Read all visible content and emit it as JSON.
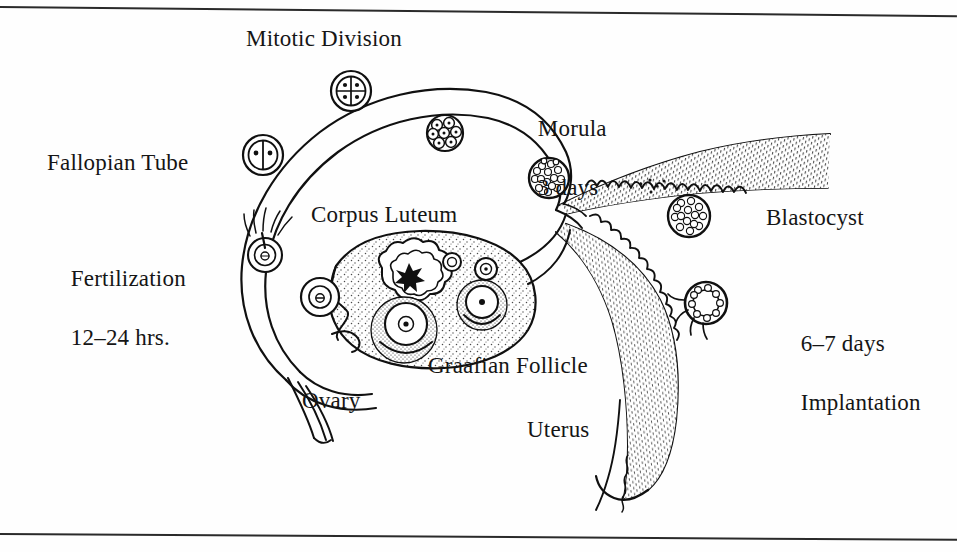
{
  "figure": {
    "width": 957,
    "height": 552,
    "background_color": "#fefefe",
    "ink_color": "#101010",
    "stipple_color": "#3a3a3a"
  },
  "labels": {
    "mitotic_division": "Mitotic Division",
    "fallopian_tube": "Fallopian Tube",
    "fertilization_line1": "Fertilization",
    "fertilization_line2": "12–24 hrs.",
    "corpus_luteum": "Corpus Luteum",
    "morula_line1": "Morula",
    "morula_line2": "3 days",
    "blastocyst": "Blastocyst",
    "implantation_line1": "6–7 days",
    "implantation_line2": "Implantation",
    "graafian_follicle": "Graafian Follicle",
    "ovary": "Ovary",
    "uterus": "Uterus"
  },
  "stages": [
    {
      "name": "fertilized-ovum",
      "label_ref": "fertilization_line1",
      "cells": 1,
      "timing": "12–24 hrs."
    },
    {
      "name": "two-cell-stage",
      "label_ref": "mitotic_division",
      "cells": 2,
      "timing": ""
    },
    {
      "name": "four-cell-stage",
      "label_ref": "mitotic_division",
      "cells": 4,
      "timing": ""
    },
    {
      "name": "eight-cell-stage",
      "label_ref": "mitotic_division",
      "cells": 8,
      "timing": ""
    },
    {
      "name": "morula",
      "label_ref": "morula_line1",
      "cells": 32,
      "timing": "3 days"
    },
    {
      "name": "blastocyst",
      "label_ref": "blastocyst",
      "cells": 64,
      "timing": ""
    },
    {
      "name": "implanting-blastocyst",
      "label_ref": "implantation_line1",
      "cells": 64,
      "timing": "6–7 days"
    }
  ],
  "anatomy": [
    {
      "name": "fallopian-tube",
      "label_ref": "fallopian_tube"
    },
    {
      "name": "ovary",
      "label_ref": "ovary"
    },
    {
      "name": "corpus-luteum",
      "label_ref": "corpus_luteum"
    },
    {
      "name": "graafian-follicle",
      "label_ref": "graafian_follicle"
    },
    {
      "name": "uterus",
      "label_ref": "uterus"
    },
    {
      "name": "endometrium",
      "label_ref": "uterus"
    }
  ],
  "borders": {
    "top_rule": true,
    "bottom_rule": true
  }
}
